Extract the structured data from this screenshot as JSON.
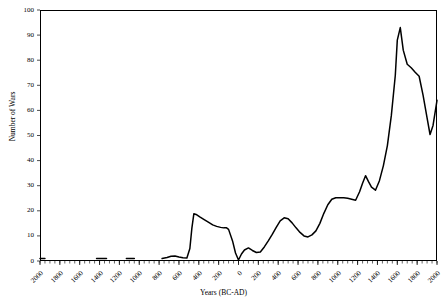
{
  "chart_data": {
    "type": "line",
    "title": "",
    "xlabel": "Years (BC-AD)",
    "ylabel": "Number of Wars",
    "xlim": [
      -2000,
      2000
    ],
    "ylim": [
      0,
      100
    ],
    "grid": false,
    "legend": "none",
    "line_color": "#000000",
    "background_color": "#ffffff",
    "axis_color": "#000000",
    "y_ticks": [
      0,
      10,
      20,
      30,
      40,
      50,
      60,
      70,
      80,
      90,
      100
    ],
    "y_tick_labels": [
      "0",
      "10",
      "20",
      "30",
      "40",
      "50",
      "60",
      "70",
      "80",
      "90",
      "100"
    ],
    "x_ticks": [
      -2000,
      -1800,
      -1600,
      -1400,
      -1200,
      -1000,
      -800,
      -600,
      -400,
      -200,
      0,
      200,
      400,
      600,
      800,
      1000,
      1200,
      1400,
      1600,
      1800,
      2000
    ],
    "x_tick_labels": [
      "2000",
      "1800",
      "1600",
      "1400",
      "1200",
      "1000",
      "800",
      "600",
      "400",
      "200",
      "0",
      "200",
      "400",
      "600",
      "800",
      "1000",
      "1200",
      "1400",
      "1600",
      "1800",
      "2000"
    ],
    "x_minor_tick_step": 50,
    "series": [
      {
        "name": "Number of Wars",
        "segments": [
          {
            "x": [
              -2000,
              -1950
            ],
            "y": [
              1,
              1
            ]
          },
          {
            "x": [
              -1430,
              -1330
            ],
            "y": [
              1,
              1
            ]
          },
          {
            "x": [
              -1130,
              -1050
            ],
            "y": [
              1,
              1
            ]
          },
          {
            "x": [
              -770,
              -720,
              -680,
              -640,
              -600,
              -560,
              -520,
              -490,
              -470,
              -450,
              -420,
              -390,
              -350,
              -300,
              -260,
              -220,
              -180,
              -150,
              -120,
              -100,
              -60,
              -30,
              0,
              30,
              60,
              100,
              140,
              180,
              220,
              260,
              300,
              340,
              380,
              420,
              460,
              500,
              540,
              580,
              620,
              660,
              700,
              740,
              780,
              820,
              860,
              900,
              940,
              980,
              1020,
              1060,
              1100,
              1140,
              1180,
              1220,
              1250,
              1280,
              1310,
              1340,
              1380,
              1420,
              1460,
              1500,
              1540,
              1580,
              1600,
              1630,
              1660,
              1700,
              1740,
              1780,
              1820,
              1860,
              1900,
              1930,
              1960,
              2000
            ],
            "y": [
              1,
              1.4,
              1.9,
              2,
              1.6,
              1.3,
              1.2,
              5,
              13,
              18.8,
              18.4,
              17.6,
              16.6,
              15.4,
              14.4,
              13.8,
              13.4,
              13.2,
              13.2,
              12.6,
              8,
              3.2,
              0.4,
              2.8,
              4.4,
              5.2,
              4.2,
              3.4,
              3.6,
              5.6,
              8,
              10.6,
              13.4,
              16,
              17.2,
              16.8,
              15.2,
              13.2,
              11.4,
              10,
              9.6,
              10.4,
              12,
              15,
              19,
              22.4,
              24.6,
              25.2,
              25.2,
              25.2,
              25,
              24.6,
              24.2,
              27.6,
              31,
              34,
              31.6,
              29.4,
              28.2,
              32,
              38,
              46,
              58,
              74,
              88,
              93,
              84,
              78.4,
              77,
              75.2,
              73.6,
              66,
              57,
              50.4,
              54,
              64,
              81
            ]
          }
        ]
      }
    ]
  }
}
